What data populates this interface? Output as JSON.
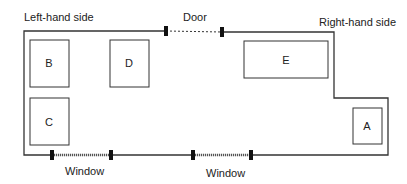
{
  "diagram": {
    "labels": {
      "left_side": "Left-hand side",
      "right_side": "Right-hand side",
      "door": "Door",
      "window_1": "Window",
      "window_2": "Window"
    },
    "rooms": [
      {
        "id": "B",
        "label": "B"
      },
      {
        "id": "D",
        "label": "D"
      },
      {
        "id": "E",
        "label": "E"
      },
      {
        "id": "C",
        "label": "C"
      },
      {
        "id": "A",
        "label": "A"
      }
    ],
    "colors": {
      "line": "#333333",
      "marker": "#111111"
    }
  }
}
